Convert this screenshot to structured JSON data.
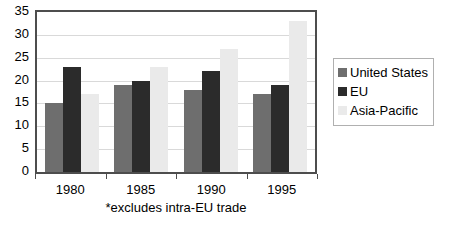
{
  "chart_data": {
    "type": "bar",
    "title": "",
    "subtitle": "",
    "xlabel": "",
    "ylabel": "",
    "categories": [
      "1980",
      "1985",
      "1990",
      "1995"
    ],
    "series": [
      {
        "name": "United States",
        "values": [
          15,
          19,
          18,
          17
        ],
        "color": "#6e6e6e"
      },
      {
        "name": "EU",
        "values": [
          23,
          20,
          22,
          19
        ],
        "color": "#2b2b2b"
      },
      {
        "name": "Asia-Pacific",
        "values": [
          17,
          23,
          27,
          33
        ],
        "color": "#eaeaea"
      }
    ],
    "ylim": [
      0,
      35
    ],
    "yticks": [
      0,
      5,
      10,
      15,
      20,
      25,
      30,
      35
    ],
    "grid": true,
    "legend_position": "right",
    "annotation": "*excludes intra-EU trade"
  },
  "axis": {
    "y_tick_labels": [
      "35",
      "30",
      "25",
      "20",
      "15",
      "10",
      "5",
      "0"
    ],
    "x_tick_labels": [
      "1980",
      "1985",
      "1990",
      "1995"
    ]
  },
  "legend": {
    "items": [
      {
        "label": "United States",
        "color": "#6e6e6e"
      },
      {
        "label": "EU",
        "color": "#2b2b2b"
      },
      {
        "label": "Asia-Pacific",
        "color": "#eaeaea"
      }
    ]
  },
  "footnote": {
    "text": "*excludes intra-EU trade"
  }
}
